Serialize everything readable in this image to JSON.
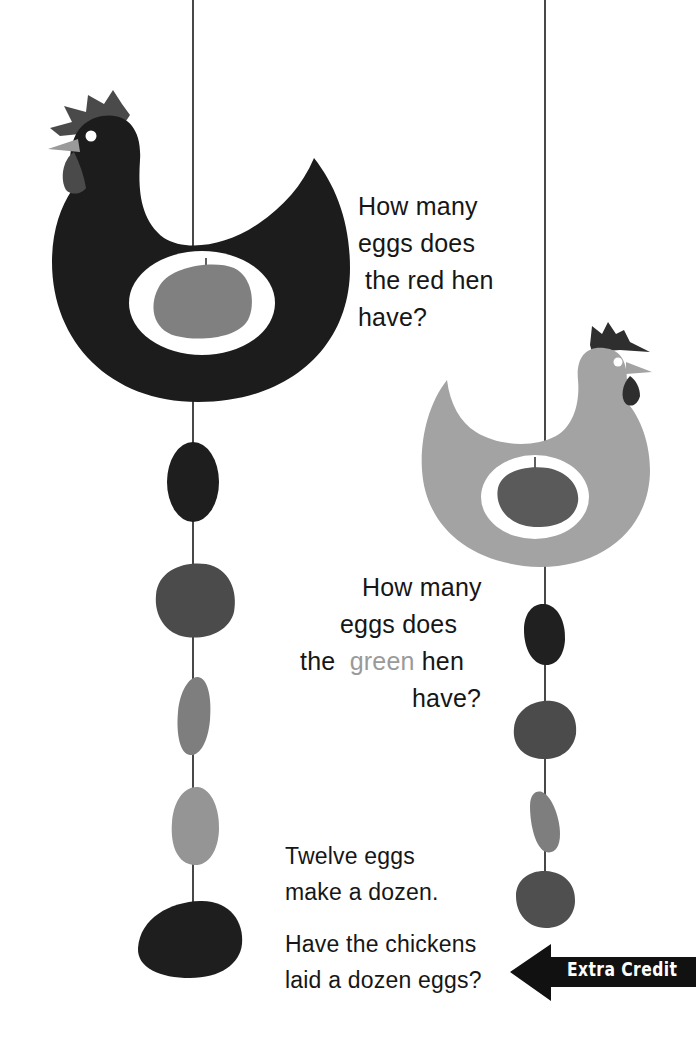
{
  "worksheet": {
    "red_hen_question": {
      "lines": [
        "How many",
        "eggs does",
        "the red hen",
        "have?"
      ]
    },
    "green_hen_question": {
      "lines": [
        "How many",
        "eggs does"
      ],
      "line3_prefix": "the",
      "line3_highlight": "green",
      "line3_suffix": "hen",
      "line4": "have?"
    },
    "dozen_prompt": {
      "lines": [
        "Twelve eggs",
        "make a dozen."
      ],
      "question_lines": [
        "Have the chickens",
        "laid a dozen eggs?"
      ]
    },
    "extra_credit": {
      "label": "Extra Credit",
      "icon": "left-arrow-icon"
    }
  },
  "illustration": {
    "red_hen": {
      "body_color": "#1c1c1c",
      "comb_color": "#4a4a4a",
      "beak_color": "#9a9a9a",
      "wattle_color": "#4a4a4a",
      "belly_egg_color": "#808080",
      "egg_count_on_string": 5,
      "string_eggs": [
        {
          "color": "#1e1e1e"
        },
        {
          "color": "#4b4b4b"
        },
        {
          "color": "#7e7e7e"
        },
        {
          "color": "#959595"
        },
        {
          "color": "#1e1e1e"
        }
      ]
    },
    "green_hen": {
      "body_color": "#a3a3a3",
      "comb_color": "#2e2e2e",
      "beak_color": "#9a9a9a",
      "wattle_color": "#2e2e2e",
      "belly_egg_color": "#5a5a5a",
      "egg_count_on_string": 4,
      "string_eggs": [
        {
          "color": "#202020"
        },
        {
          "color": "#4b4b4b"
        },
        {
          "color": "#7e7e7e"
        },
        {
          "color": "#4f4f4f"
        }
      ]
    },
    "string_color": "#1a1a1a"
  }
}
